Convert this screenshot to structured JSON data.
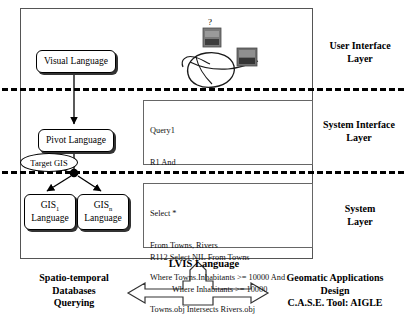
{
  "diagram": {
    "layers": [
      {
        "id": "user-interface",
        "label_line1": "User Interface",
        "label_line2": "Layer"
      },
      {
        "id": "system-interface",
        "label_line1": "System Interface",
        "label_line2": "Layer"
      },
      {
        "id": "system",
        "label_line1": "System",
        "label_line2": "Layer"
      }
    ],
    "nodes": {
      "visual_language": "Visual Language",
      "pivot_language": "Pivot Language",
      "target_gis": "Target GIS",
      "gis1_line1": "GIS",
      "gis1_sub": "1",
      "gis1_line2": "Language",
      "gisn_line1": "GIS",
      "gisn_sub": "n",
      "gisn_line2": "Language"
    },
    "sketch": {
      "question_mark": "?",
      "note": "hand-drawn user sketch"
    },
    "query_box": {
      "lines": [
        "Query1",
        "R1 And",
        "R11 Topological_Intersection",
        "R111 Select * From Rivers Where NIL",
        "R112 Select NIL From Towns"
      ],
      "indented_line": "Where Inhabitants >= 10000"
    },
    "sql_box": {
      "lines": [
        "Select *",
        "From Towns, Rivers",
        "Where Towns.Inhabitants >= 10000 And",
        "Towns.obj Intersects Rivers.obj"
      ],
      "final_line": "Into Query1"
    },
    "footer": {
      "center_label": "LVIS Language",
      "left_line1": "Spatio-temporal",
      "left_line2": "Databases",
      "left_line3": "Querying",
      "right_line1": "Geomatic Applications",
      "right_line2": "Design",
      "right_line3": "C.A.S.E. Tool: AIGLE"
    },
    "colors": {
      "line": "#555555",
      "dash": "#000000",
      "box_border": "#000000",
      "shadow": "#333333",
      "sketch": "#1a1a1a",
      "photo_fill": "#6e6e6e"
    }
  }
}
